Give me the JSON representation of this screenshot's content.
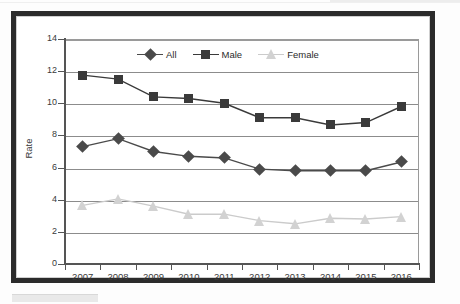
{
  "chart_data": {
    "type": "line",
    "title": "",
    "xlabel": "",
    "ylabel": "Rate",
    "categories": [
      "2007",
      "2008",
      "2009",
      "2010",
      "2011",
      "2012",
      "2013",
      "2014",
      "2015",
      "2016"
    ],
    "ylim": [
      0,
      14
    ],
    "ytick_values": [
      0,
      2,
      4,
      6,
      8,
      10,
      12,
      14
    ],
    "ytick_labels": [
      "0",
      "2",
      "4",
      "6",
      "8",
      "10",
      "12",
      "14"
    ],
    "grid": true,
    "legend_position": "top-center",
    "series": [
      {
        "name": "All",
        "marker": "diamond",
        "color": "#4a4a4a",
        "line_color": "#4a4a4a",
        "values": [
          7.3,
          7.8,
          7.0,
          6.7,
          6.6,
          5.9,
          5.8,
          5.8,
          5.8,
          6.35
        ]
      },
      {
        "name": "Male",
        "marker": "square",
        "color": "#3a3a3a",
        "line_color": "#3a3a3a",
        "values": [
          11.75,
          11.5,
          10.4,
          10.3,
          10.0,
          9.1,
          9.1,
          8.65,
          8.8,
          9.8
        ]
      },
      {
        "name": "Female",
        "marker": "triangle",
        "color": "#d2d2d2",
        "line_color": "#cbcbcb",
        "values": [
          3.65,
          4.05,
          3.6,
          3.1,
          3.1,
          2.7,
          2.5,
          2.85,
          2.8,
          2.95
        ]
      }
    ]
  },
  "legend": {
    "items": [
      {
        "label": "All",
        "marker": "diamond-icon"
      },
      {
        "label": "Male",
        "marker": "square-icon"
      },
      {
        "label": "Female",
        "marker": "triangle-icon"
      }
    ]
  },
  "axes": {
    "y_title": "Rate"
  },
  "colors": {
    "frame": "#2b2b2b",
    "gridline": "#8c8c8c",
    "axis": "#555555",
    "all_series": "#4a4a4a",
    "male_series": "#3a3a3a",
    "female_series": "#d2d2d2",
    "background": "#ffffff"
  }
}
